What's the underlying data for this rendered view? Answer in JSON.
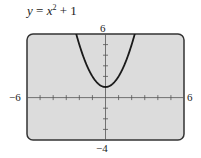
{
  "title": {
    "var_y": "y",
    "eq": " = ",
    "var_x": "x",
    "exp": "2",
    "rest": " + 1"
  },
  "labels": {
    "xmin": "−6",
    "xmax": "6",
    "ymin": "−4",
    "ymax": "6"
  },
  "colors": {
    "screen_bg": "#dcdcdc",
    "border": "#333333",
    "curve": "#1a1a1a"
  },
  "chart_data": {
    "type": "line",
    "function": "x^2 + 1",
    "xlim": [
      -6,
      6
    ],
    "ylim": [
      -4,
      6
    ],
    "xscale": 1,
    "yscale": 1,
    "grid": false,
    "x": [
      -2.24,
      -2,
      -1.5,
      -1,
      -0.5,
      0,
      0.5,
      1,
      1.5,
      2,
      2.24
    ],
    "series": [
      {
        "name": "y = x^2 + 1",
        "values": [
          6,
          5,
          3.25,
          2,
          1.25,
          1,
          1.25,
          2,
          3.25,
          5,
          6
        ]
      }
    ],
    "tick_labels": {
      "x": [
        "-6",
        "6"
      ],
      "y": [
        "-4",
        "6"
      ]
    }
  }
}
